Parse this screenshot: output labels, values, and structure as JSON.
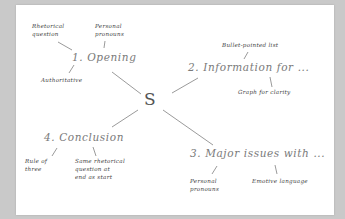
{
  "diagram": {
    "type": "mind-map",
    "center": {
      "label": "S"
    },
    "branches": [
      {
        "label": "1. Opening",
        "children": [
          "Rhetorical\nquestion",
          "Personal\npronouns",
          "Authoritative"
        ]
      },
      {
        "label": "2. Information for ...",
        "children": [
          "Bullet-pointed list",
          "Graph for clarity"
        ]
      },
      {
        "label": "3. Major issues with ...",
        "children": [
          "Personal\npronouns",
          "Emotive language"
        ]
      },
      {
        "label": "4. Conclusion",
        "children": [
          "Rule of\nthree",
          "Same rhetorical\nquestion at\nend as start"
        ]
      }
    ]
  },
  "colors": {
    "background": "#c9c9c9",
    "card": "#ffffff",
    "line": "#8a8a8a",
    "main_text": "#7a7a7a",
    "sub_text": "#3e3e3e"
  }
}
